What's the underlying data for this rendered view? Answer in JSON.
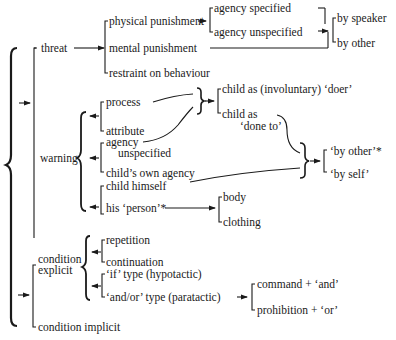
{
  "diagram": {
    "type": "classification-tree",
    "nodes": {
      "threat": "threat",
      "physical_punishment": "physical punishment",
      "agency_specified": "agency specified",
      "agency_unspecified_top": "agency unspecified",
      "by_speaker": "by speaker",
      "by_other": "by other",
      "mental_punishment": "mental punishment",
      "restraint": "restraint on behaviour",
      "warning": "warning",
      "process": "process",
      "attribute": "attribute",
      "agency": "agency",
      "unspecified": "unspecified",
      "childs_own_agency": "child’s own agency",
      "child_himself": "child himself",
      "his_person": "his ‘person’*",
      "child_doer": "child as (involuntary) ‘doer’",
      "child_as": "child as",
      "done_to": "‘done to’",
      "by_other_q": "‘by other’*",
      "by_self_q": "‘by self’",
      "body": "body",
      "clothing": "clothing",
      "condition": "condition",
      "explicit": "explicit",
      "repetition": "repetition",
      "continuation": "continuation",
      "if_type": "‘if’ type (hypotactic)",
      "and_or_type": "‘and/or’ type (paratactic)",
      "command_and": "command + ‘and’",
      "prohibition_or": "prohibition + ‘or’",
      "condition_implicit": "condition implicit"
    },
    "edges": [
      [
        "root",
        "threat"
      ],
      [
        "root",
        "warning"
      ],
      [
        "root",
        "condition explicit"
      ],
      [
        "root",
        "condition implicit"
      ],
      [
        "threat",
        "physical punishment"
      ],
      [
        "threat",
        "mental punishment"
      ],
      [
        "threat",
        "restraint on behaviour"
      ],
      [
        "physical punishment",
        "agency specified"
      ],
      [
        "physical punishment",
        "agency unspecified"
      ],
      [
        "agency unspecified",
        "by speaker"
      ],
      [
        "agency unspecified",
        "by other"
      ],
      [
        "mental punishment",
        "by speaker/by other"
      ],
      [
        "warning",
        "process"
      ],
      [
        "warning",
        "attribute"
      ],
      [
        "warning",
        "agency unspecified"
      ],
      [
        "warning",
        "child's own agency"
      ],
      [
        "warning",
        "child himself"
      ],
      [
        "warning",
        "his 'person'*"
      ],
      [
        "process/attribute",
        "child as (involuntary) 'doer'"
      ],
      [
        "process/attribute",
        "child as 'done to'"
      ],
      [
        "child as 'done to' / agency unspecified / child himself",
        "'by other'*"
      ],
      [
        "child as 'done to' / agency unspecified / child himself",
        "'by self'"
      ],
      [
        "his 'person'*",
        "body"
      ],
      [
        "his 'person'*",
        "clothing"
      ],
      [
        "condition explicit",
        "repetition"
      ],
      [
        "condition explicit",
        "continuation"
      ],
      [
        "condition explicit",
        "'if' type (hypotactic)"
      ],
      [
        "condition explicit",
        "'and/or' type (paratactic)"
      ],
      [
        "'and/or' type (paratactic)",
        "command + 'and'"
      ],
      [
        "'and/or' type (paratactic)",
        "prohibition + 'or'"
      ]
    ],
    "colors": {
      "ink": "#1a1a1a",
      "background": "#ffffff"
    }
  }
}
